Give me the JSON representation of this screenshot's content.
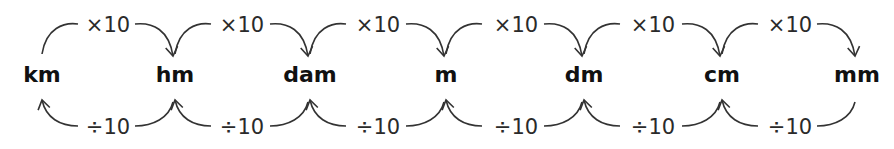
{
  "diagram": {
    "units": [
      {
        "label": "km",
        "x": 42
      },
      {
        "label": "hm",
        "x": 175
      },
      {
        "label": "dam",
        "x": 310
      },
      {
        "label": "m",
        "x": 446
      },
      {
        "label": "dm",
        "x": 584
      },
      {
        "label": "cm",
        "x": 722
      },
      {
        "label": "mm",
        "x": 857
      }
    ],
    "multiply_label": "×10",
    "divide_label": "÷10",
    "top_arrows": [
      {
        "from": "km",
        "to": "hm",
        "label": "×10"
      },
      {
        "from": "hm",
        "to": "dam",
        "label": "×10"
      },
      {
        "from": "dam",
        "to": "m",
        "label": "×10"
      },
      {
        "from": "m",
        "to": "dm",
        "label": "×10"
      },
      {
        "from": "dm",
        "to": "cm",
        "label": "×10"
      },
      {
        "from": "cm",
        "to": "mm",
        "label": "×10"
      }
    ],
    "bottom_arrows": [
      {
        "from": "hm",
        "to": "km",
        "label": "÷10"
      },
      {
        "from": "dam",
        "to": "hm",
        "label": "÷10"
      },
      {
        "from": "m",
        "to": "dam",
        "label": "÷10"
      },
      {
        "from": "dm",
        "to": "m",
        "label": "÷10"
      },
      {
        "from": "cm",
        "to": "dm",
        "label": "÷10"
      },
      {
        "from": "mm",
        "to": "cm",
        "label": "÷10"
      }
    ],
    "colors": {
      "stroke": "#333333",
      "text": "#111111"
    }
  }
}
